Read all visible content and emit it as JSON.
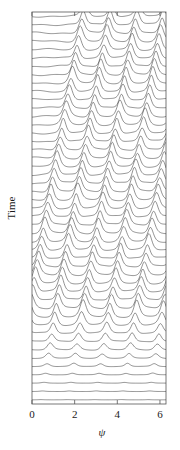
{
  "figure": {
    "type": "waterfall-line-plot",
    "background": "#ffffff",
    "line_color": "#3a3a3a",
    "axis_color": "#555555",
    "width": 180,
    "height": 450
  },
  "axes": {
    "x": {
      "label": "ψ",
      "ticks": [
        "0",
        "2",
        "4",
        "6"
      ],
      "tick_values": [
        0,
        2,
        4,
        6
      ],
      "range": [
        0,
        6.2832
      ],
      "tick_side": "both-inward"
    },
    "y": {
      "label": "Time",
      "ticks": [],
      "direction": "upward",
      "rotated": true
    }
  },
  "chart_data": {
    "type": "line",
    "title": "",
    "xlabel": "ψ",
    "ylabel": "Time",
    "xlim": [
      0,
      6.2832
    ],
    "ylim": [
      0,
      47
    ],
    "grid": false,
    "legend": null,
    "x": [
      0.0,
      0.1,
      0.2,
      0.3,
      0.4,
      0.5,
      0.6,
      0.7,
      0.8,
      0.9,
      1.0,
      1.1,
      1.2,
      1.3,
      1.4,
      1.5,
      1.6,
      1.7,
      1.8,
      1.9,
      2.0,
      2.1,
      2.2,
      2.3,
      2.4,
      2.5,
      2.6,
      2.7,
      2.8,
      2.9,
      3.0,
      3.1,
      3.2,
      3.3,
      3.4,
      3.5,
      3.6,
      3.7,
      3.8,
      3.9,
      4.0,
      4.1,
      4.2,
      4.3,
      4.4,
      4.5,
      4.6,
      4.7,
      4.8,
      4.9,
      5.0,
      5.1,
      5.2,
      5.3,
      5.4,
      5.5,
      5.6,
      5.7,
      5.8,
      5.9,
      6.0,
      6.1,
      6.2,
      6.2832
    ],
    "n_traces": 47,
    "trace_spacing_px": 8.34,
    "n_peaks_per_trace": 5,
    "peak_width": 0.17,
    "peak_drift_per_trace": 0.072,
    "amplitude_profile": "ramps from 0.02 at trace 0 (bottom, earliest Time) to 1.0 by trace 10 and held",
    "series_note": "Each trace t is y = sum over k of A(t)*sech^2((psi - (phi0 + 0.072*t + 1.2566*k))/0.17), periodic in 2*pi/5."
  },
  "geometry": {
    "plot_left": 32,
    "plot_right": 166,
    "plot_top": 12,
    "plot_bottom": 404,
    "xlabel_x": 102,
    "xlabel_y": 436,
    "ylabel_x": 15,
    "ylabel_y": 208
  }
}
